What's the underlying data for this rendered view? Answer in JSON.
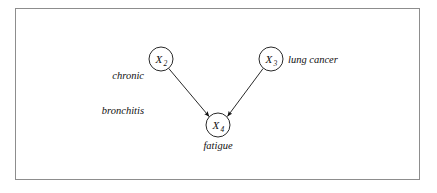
{
  "figure": {
    "type": "causal-dag",
    "background_color": "#ffffff",
    "frame_color": "#8d8d8d",
    "stroke_color": "#111111",
    "nodes": [
      {
        "id": "X2",
        "var": "X",
        "subscript": "2",
        "label": "chronic\nbronchitis",
        "label_line_1": "chronic",
        "label_line_2": "bronchitis",
        "label_position": "left",
        "cx": 161,
        "cy": 59,
        "r": 12
      },
      {
        "id": "X3",
        "var": "X",
        "subscript": "3",
        "label": "lung cancer",
        "label_position": "right",
        "cx": 271,
        "cy": 59,
        "r": 12
      },
      {
        "id": "X4",
        "var": "X",
        "subscript": "4",
        "label": "fatigue",
        "label_position": "below",
        "cx": 218,
        "cy": 125,
        "r": 12
      }
    ],
    "edges": [
      {
        "from": "X2",
        "to": "X4",
        "arrowhead": "filled-triangle"
      },
      {
        "from": "X3",
        "to": "X4",
        "arrowhead": "filled-triangle"
      }
    ]
  }
}
